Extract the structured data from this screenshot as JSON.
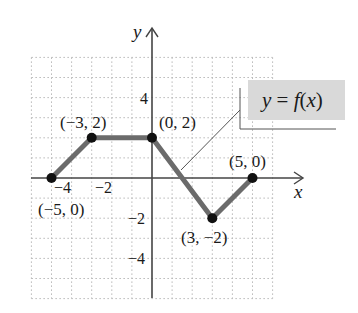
{
  "chart_data": {
    "type": "line",
    "title": "",
    "function_label": "y = f(x)",
    "xlabel": "x",
    "ylabel": "y",
    "xlim": [
      -6,
      6
    ],
    "ylim": [
      -6,
      6
    ],
    "grid": true,
    "grid_style": "dotted",
    "x_ticks": [
      {
        "value": -4,
        "label": "−4"
      },
      {
        "value": -2,
        "label": "−2"
      }
    ],
    "y_ticks": [
      {
        "value": 4,
        "label": "4"
      },
      {
        "value": -2,
        "label": "−2"
      },
      {
        "value": -4,
        "label": "−4"
      }
    ],
    "series": [
      {
        "name": "y = f(x)",
        "x": [
          -5,
          -3,
          0,
          3,
          5
        ],
        "y": [
          0,
          2,
          2,
          -2,
          0
        ]
      }
    ],
    "points": [
      {
        "x": -5,
        "y": 0,
        "label": "(−5, 0)"
      },
      {
        "x": -3,
        "y": 2,
        "label": "(−3, 2)"
      },
      {
        "x": 0,
        "y": 2,
        "label": "(0, 2)"
      },
      {
        "x": 3,
        "y": -2,
        "label": "(3, −2)"
      },
      {
        "x": 5,
        "y": 0,
        "label": "(5, 0)"
      }
    ],
    "colors": {
      "curve": "#6b6b6b",
      "points": "#111111",
      "axes": "#444444",
      "grid": "#b8b8b8",
      "label_box": "#d9d9d9"
    }
  },
  "labels": {
    "x_axis": "x",
    "y_axis": "y",
    "function": "y = f(x)",
    "ticks": {
      "x_neg4": "−4",
      "x_neg2": "−2",
      "y_4": "4",
      "y_neg2": "−2",
      "y_neg4": "−4"
    },
    "points": {
      "p1": "(−5, 0)",
      "p2": "(−3, 2)",
      "p3": "(0, 2)",
      "p4": "(3, −2)",
      "p5": "(5, 0)"
    }
  }
}
